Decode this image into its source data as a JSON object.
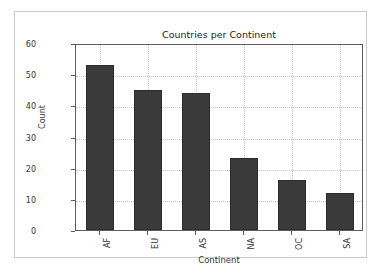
{
  "figure": {
    "background_color": "#ffffff",
    "frame_color": "#c9c9c9",
    "axes_color": "#5d5d5d",
    "grid_color": "#c4c4c4",
    "bar_color": "#3a3a3a"
  },
  "chart_data": {
    "type": "bar",
    "title": "Countries per Continent",
    "xlabel": "Continent",
    "ylabel": "Count",
    "categories": [
      "AF",
      "EU",
      "AS",
      "NA",
      "OC",
      "SA"
    ],
    "values": [
      53,
      45,
      44,
      23,
      16,
      12
    ],
    "ylim": [
      0,
      60
    ],
    "yticks": [
      0,
      10,
      20,
      30,
      40,
      50,
      60
    ],
    "ytick_labels": [
      "0",
      "10",
      "20",
      "30",
      "40",
      "50",
      "60"
    ],
    "xtick_labels": [
      "AF",
      "EU",
      "AS",
      "NA",
      "OC",
      "SA"
    ],
    "grid": true,
    "grid_style": "dotted",
    "legend": null,
    "legend_position": "none",
    "xtick_label_rotation": 90,
    "bar_color": "#3a3a3a"
  }
}
